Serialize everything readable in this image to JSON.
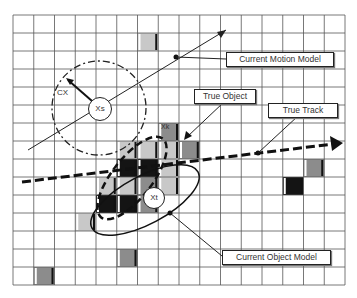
{
  "diagram": {
    "grid": {
      "x0": 13,
      "y0": 15,
      "cols": 16,
      "rows": 15,
      "cell_w": 20.75,
      "cell_h": 18
    },
    "cells": [
      {
        "c": 6,
        "r": 1,
        "shade": "light"
      },
      {
        "c": 7,
        "r": 6,
        "shade": "mid",
        "label": "Xk"
      },
      {
        "c": 7,
        "r": 7,
        "shade": "light"
      },
      {
        "c": 8,
        "r": 7,
        "shade": "mid"
      },
      {
        "c": 5,
        "r": 7,
        "shade": "light"
      },
      {
        "c": 6,
        "r": 7,
        "shade": "light"
      },
      {
        "c": 5,
        "r": 8,
        "shade": "dark"
      },
      {
        "c": 6,
        "r": 8,
        "shade": "dark"
      },
      {
        "c": 7,
        "r": 8,
        "shade": "light"
      },
      {
        "c": 4,
        "r": 9,
        "shade": "light"
      },
      {
        "c": 5,
        "r": 9,
        "shade": "light"
      },
      {
        "c": 6,
        "r": 9,
        "shade": "mid"
      },
      {
        "c": 7,
        "r": 9,
        "shade": "light"
      },
      {
        "c": 4,
        "r": 10,
        "shade": "dark"
      },
      {
        "c": 5,
        "r": 10,
        "shade": "dark"
      },
      {
        "c": 6,
        "r": 10,
        "shade": "mid"
      },
      {
        "c": 3,
        "r": 11,
        "shade": "light"
      },
      {
        "c": 14,
        "r": 8,
        "shade": "mid"
      },
      {
        "c": 13,
        "r": 9,
        "shade": "dark"
      },
      {
        "c": 5,
        "r": 13,
        "shade": "mid"
      },
      {
        "c": 1,
        "r": 14,
        "shade": "mid"
      }
    ],
    "colors": {
      "light": "#c8c8c8",
      "mid": "#8c8c8c",
      "dark": "#141414",
      "grid": "#555555",
      "line": "#111111"
    },
    "nodes": [
      {
        "id": "xs",
        "label": "Xs",
        "x": 99,
        "y": 108,
        "r": 11
      },
      {
        "id": "xt",
        "label": "Xt",
        "x": 153,
        "y": 197,
        "r": 10
      }
    ],
    "labels": {
      "cx": "CX",
      "xk": "Xk"
    },
    "callouts": [
      {
        "id": "current-motion-model",
        "text": "Current Motion Model",
        "x": 226,
        "y": 52,
        "w": 106
      },
      {
        "id": "true-object",
        "text": "True Object",
        "x": 194,
        "y": 89,
        "w": 60
      },
      {
        "id": "true-track",
        "text": "True Track",
        "x": 268,
        "y": 103,
        "w": 68
      },
      {
        "id": "current-object-model",
        "text": "Current Object Model",
        "x": 222,
        "y": 250,
        "w": 107
      }
    ]
  }
}
